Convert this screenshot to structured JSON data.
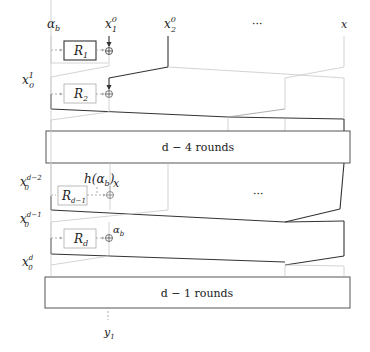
{
  "diagram": {
    "top_labels": {
      "alpha": "α",
      "alpha_sub": "b",
      "x1": "x",
      "x1_sup": "0",
      "x1_sub": "1",
      "x2": "x",
      "x2_sup": "0",
      "x2_sub": "2",
      "ellipsis": "···",
      "x": "x"
    },
    "left_labels": {
      "x01": "x",
      "x01_sup": "1",
      "x01_sub": "0",
      "x0d2": "x",
      "x0d2_sup": "d−2",
      "x0d2_sub": "0",
      "x0d1": "x",
      "x0d1_sup": "d−1",
      "x0d1_sub": "0",
      "x0d": "x",
      "x0d_sup": "d",
      "x0d_sub": "0"
    },
    "round_boxes": {
      "r1": "R",
      "r1_sub": "1",
      "r2": "R",
      "r2_sub": "2",
      "rd1": "R",
      "rd1_sub": "d−1",
      "rd": "R",
      "rd_sub": "d"
    },
    "annotations": {
      "h_alpha": "h(α",
      "h_alpha_sub": "b",
      "h_alpha_close": ")",
      "x_label": "x",
      "alpha_b": "α",
      "alpha_b_sub": "b",
      "mid_ellipsis": "···"
    },
    "big_boxes": {
      "rounds_d4": "d − 4 rounds",
      "rounds_d1": "d − 1 rounds"
    },
    "output": {
      "y": "y",
      "y_sub": "1"
    },
    "xor_symbol": "⊕"
  }
}
